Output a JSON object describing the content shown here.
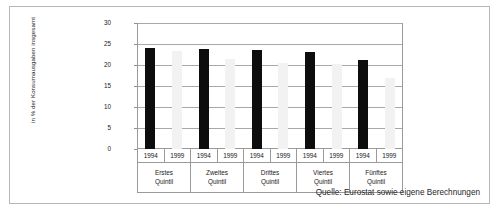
{
  "figure": {
    "source_note": "Quelle: Eurostat sowie eigene Berechnungen"
  },
  "chart_data": {
    "type": "bar",
    "title": "",
    "xlabel": "",
    "ylabel": "in % der Konsumausgaben insgesamt",
    "ylim": [
      0,
      30
    ],
    "yticks": [
      0,
      5,
      10,
      15,
      20,
      25,
      30
    ],
    "ytick_labels": [
      "0",
      "5",
      "10",
      "15",
      "20",
      "25",
      "30"
    ],
    "grid": true,
    "legend": "none",
    "categories": [
      "Erstes Quintil",
      "Zweites Quintil",
      "Drittes Quintil",
      "Viertes Quintil",
      "Fünftes Quintil"
    ],
    "category_lines": [
      [
        "Erstes",
        "Quintil"
      ],
      [
        "Zweites",
        "Quintil"
      ],
      [
        "Drittes",
        "Quintil"
      ],
      [
        "Viertes",
        "Quintil"
      ],
      [
        "Fünftes",
        "Quintil"
      ]
    ],
    "series": [
      {
        "name": "1994",
        "color": "#0d0d0d",
        "values": [
          24.0,
          23.8,
          23.6,
          23.0,
          21.2
        ]
      },
      {
        "name": "1999",
        "color": "#f2f2f2",
        "values": [
          23.3,
          21.4,
          20.5,
          20.3,
          16.8
        ]
      }
    ],
    "year_labels": [
      "1994",
      "1999",
      "1994",
      "1999",
      "1994",
      "1999",
      "1994",
      "1999",
      "1994",
      "1999"
    ]
  }
}
